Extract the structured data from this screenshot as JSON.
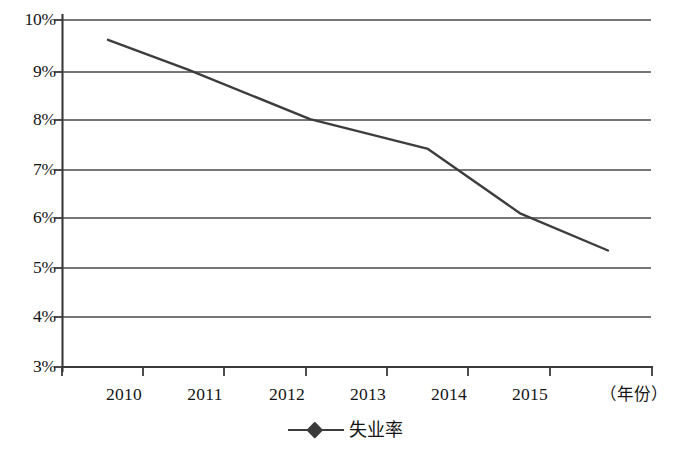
{
  "chart_data": {
    "type": "line",
    "title": "",
    "subtitle": "",
    "xlabel": "（年份）",
    "ylabel": "",
    "categories": [
      "2010",
      "2011",
      "2012",
      "2013",
      "2014",
      "2015"
    ],
    "series": [
      {
        "name": "失业率",
        "values": [
          9.6,
          9.0,
          8.0,
          7.4,
          6.1,
          5.35
        ],
        "color": "#3d3d3d",
        "marker": "diamond",
        "line_width": 2.4
      }
    ],
    "ylim": [
      3,
      10
    ],
    "ytick_values": [
      10,
      9,
      8,
      7,
      6,
      5,
      4,
      3
    ],
    "ytick_labels": [
      "10%",
      "9%",
      "8%",
      "7%",
      "6%",
      "5%",
      "4%",
      "3%"
    ],
    "xtick_labels": [
      "2010",
      "2011",
      "2012",
      "2013",
      "2014",
      "2015"
    ],
    "grid": {
      "horizontal": true,
      "vertical": false,
      "color": "#4a4a4a"
    },
    "legend": {
      "position": "bottom-center",
      "entries": [
        {
          "label": "失业率",
          "marker": "diamond-line",
          "color": "#3d3d3d"
        }
      ]
    },
    "axis": {
      "left_spine": true,
      "bottom_spine": true,
      "top_spine": false,
      "right_spine": false,
      "tick_direction": "out",
      "color": "#3a3a3a"
    },
    "value_unit": "%"
  },
  "geometry": {
    "plot_left": 62,
    "plot_right": 653,
    "plot_top": 20,
    "plot_bottom": 367,
    "grid_right": 651,
    "y_per_percent": 49.57,
    "x_ticks": [
      62,
      143,
      224,
      306,
      387,
      468,
      550,
      653
    ],
    "point_x": [
      108,
      188,
      310,
      428,
      520,
      608
    ],
    "point_y": [
      33,
      72,
      120,
      149,
      213,
      259
    ],
    "label_x_centers": [
      124,
      205,
      287,
      368,
      449,
      530
    ]
  }
}
